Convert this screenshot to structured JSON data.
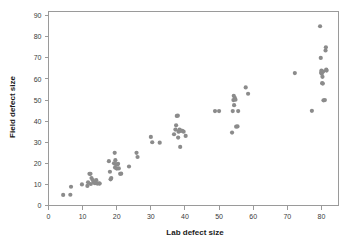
{
  "chart_data": {
    "type": "scatter",
    "title": "",
    "xlabel": "Lab defect size",
    "ylabel": "Field defect size",
    "xlim": [
      0,
      85
    ],
    "ylim": [
      0,
      92
    ],
    "xticks": [
      0,
      10,
      20,
      30,
      40,
      50,
      60,
      70,
      80
    ],
    "yticks": [
      0,
      10,
      20,
      30,
      40,
      50,
      60,
      70,
      80,
      90
    ],
    "xtick_labels": [
      "0",
      "10",
      "20",
      "30",
      "40",
      "50",
      "60",
      "70",
      "80"
    ],
    "ytick_labels": [
      "0",
      "10",
      "20",
      "30",
      "40",
      "50",
      "60",
      "70",
      "80",
      "90"
    ],
    "grid": false,
    "legend": false,
    "marker_color": "#8b8b8b",
    "marker_size": 2.1,
    "frame_color": "#9a9a9a",
    "background_color": "#ffffff",
    "series": [
      {
        "name": "defects",
        "points": [
          [
            4.3,
            5.0
          ],
          [
            6.4,
            5.1
          ],
          [
            6.6,
            8.9
          ],
          [
            9.8,
            10.0
          ],
          [
            11.4,
            9.3
          ],
          [
            11.6,
            11.0
          ],
          [
            12.0,
            15.0
          ],
          [
            12.3,
            15.0
          ],
          [
            12.4,
            10.2
          ],
          [
            12.6,
            13.0
          ],
          [
            13.0,
            12.0
          ],
          [
            13.3,
            11.0
          ],
          [
            13.6,
            10.6
          ],
          [
            14.0,
            12.0
          ],
          [
            14.3,
            10.4
          ],
          [
            14.8,
            10.5
          ],
          [
            15.0,
            10.4
          ],
          [
            17.7,
            21.0
          ],
          [
            18.0,
            16.0
          ],
          [
            18.2,
            12.4
          ],
          [
            18.4,
            13.0
          ],
          [
            19.2,
            20.0
          ],
          [
            19.4,
            25.0
          ],
          [
            19.5,
            18.0
          ],
          [
            19.6,
            21.5
          ],
          [
            19.8,
            19.5
          ],
          [
            20.0,
            17.5
          ],
          [
            20.2,
            19.5
          ],
          [
            20.4,
            19.8
          ],
          [
            20.6,
            17.6
          ],
          [
            21.0,
            15.0
          ],
          [
            21.3,
            15.1
          ],
          [
            23.6,
            18.5
          ],
          [
            25.8,
            25.0
          ],
          [
            26.1,
            23.0
          ],
          [
            30.0,
            32.5
          ],
          [
            30.4,
            30.0
          ],
          [
            32.6,
            29.8
          ],
          [
            36.8,
            33.8
          ],
          [
            37.2,
            36.0
          ],
          [
            37.4,
            38.0
          ],
          [
            37.6,
            42.5
          ],
          [
            37.9,
            42.6
          ],
          [
            38.0,
            32.2
          ],
          [
            38.1,
            35.0
          ],
          [
            38.3,
            35.2
          ],
          [
            38.4,
            36.0
          ],
          [
            38.6,
            27.8
          ],
          [
            38.8,
            35.5
          ],
          [
            39.2,
            35.4
          ],
          [
            39.6,
            35.0
          ],
          [
            40.2,
            33.0
          ],
          [
            48.8,
            44.8
          ],
          [
            50.0,
            44.8
          ],
          [
            53.8,
            34.6
          ],
          [
            54.0,
            44.8
          ],
          [
            54.2,
            50.0
          ],
          [
            54.3,
            52.0
          ],
          [
            54.4,
            47.6
          ],
          [
            54.6,
            51.0
          ],
          [
            54.8,
            50.2
          ],
          [
            55.0,
            37.4
          ],
          [
            55.4,
            37.5
          ],
          [
            55.6,
            44.8
          ],
          [
            57.8,
            56.0
          ],
          [
            58.5,
            53.0
          ],
          [
            72.2,
            62.8
          ],
          [
            77.2,
            44.9
          ],
          [
            79.6,
            85.0
          ],
          [
            79.8,
            70.0
          ],
          [
            79.9,
            63.0
          ],
          [
            80.0,
            64.0
          ],
          [
            80.1,
            62.5
          ],
          [
            80.2,
            58.0
          ],
          [
            80.3,
            61.0
          ],
          [
            80.4,
            57.8
          ],
          [
            80.5,
            63.5
          ],
          [
            80.6,
            49.9
          ],
          [
            81.0,
            50.0
          ],
          [
            81.2,
            73.5
          ],
          [
            81.3,
            75.0
          ],
          [
            81.4,
            64.5
          ],
          [
            81.5,
            64.0
          ]
        ]
      }
    ]
  },
  "axes": {
    "x_title": "Lab defect size",
    "y_title": "Field defect size"
  }
}
